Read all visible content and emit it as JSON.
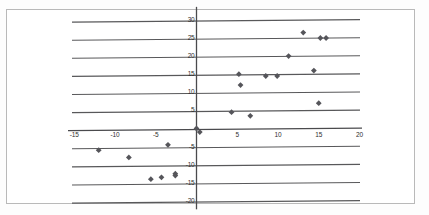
{
  "figure": {
    "title": "",
    "frame_color": "#b9b9b9",
    "background_color": "#ffffff"
  },
  "chart_data": {
    "type": "scatter",
    "title": "",
    "xlabel": "",
    "ylabel": "",
    "xlim": [
      -17.5,
      21.5
    ],
    "ylim": [
      -21.5,
      32.5
    ],
    "xticks": [
      -15,
      -10,
      -5,
      5,
      10,
      15,
      20
    ],
    "xtick_labels": [
      "-15",
      "-10",
      "-5",
      "5",
      "10",
      "15",
      "20"
    ],
    "yticks": [
      30,
      25,
      20,
      15,
      10,
      5,
      -5,
      -10,
      -15,
      -20
    ],
    "ytick_labels": [
      "30",
      "25",
      "20",
      "15",
      "10",
      "5",
      "-5",
      "-10",
      "-15",
      "-20"
    ],
    "grid": true,
    "grid_axis": "y",
    "grid_color": "#58585a",
    "legend": false,
    "marker": "diamond",
    "marker_color": "#55555a",
    "marker_size": 4,
    "axis_color": "#4a4a4d",
    "series": [
      {
        "name": "points",
        "points": [
          [
            -12.0,
            -6.0
          ],
          [
            -8.3,
            -8.0
          ],
          [
            -5.6,
            -14.0
          ],
          [
            -4.3,
            -13.5
          ],
          [
            -3.5,
            -4.5
          ],
          [
            -2.6,
            -12.5
          ],
          [
            -2.6,
            -13.0
          ],
          [
            0.0,
            0.0
          ],
          [
            0.4,
            -1.0
          ],
          [
            4.3,
            4.5
          ],
          [
            5.2,
            15.0
          ],
          [
            5.4,
            12.0
          ],
          [
            6.6,
            3.5
          ],
          [
            8.5,
            14.5
          ],
          [
            9.9,
            14.5
          ],
          [
            11.3,
            20.0
          ],
          [
            13.1,
            26.5
          ],
          [
            14.4,
            16.0
          ],
          [
            15.0,
            7.0
          ],
          [
            15.2,
            25.0
          ],
          [
            15.9,
            25.0
          ]
        ]
      }
    ]
  }
}
